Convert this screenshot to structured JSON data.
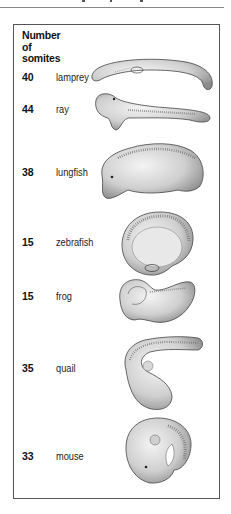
{
  "figure": {
    "header": [
      "Number",
      "of",
      "somites"
    ],
    "rows": [
      {
        "somites": "40",
        "species": "lamprey"
      },
      {
        "somites": "44",
        "species": "ray"
      },
      {
        "somites": "38",
        "species": "lungfish"
      },
      {
        "somites": "15",
        "species": "zebrafish"
      },
      {
        "somites": "15",
        "species": "frog"
      },
      {
        "somites": "35",
        "species": "quail"
      },
      {
        "somites": "33",
        "species": "mouse"
      }
    ]
  }
}
